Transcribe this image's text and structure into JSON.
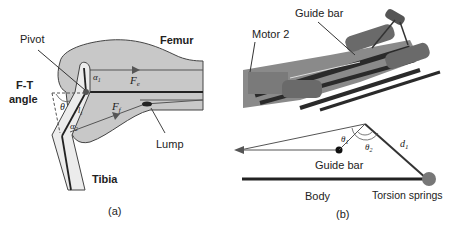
{
  "panel_a": {
    "caption": "(a)",
    "labels": {
      "pivot": "Pivot",
      "femur": "Femur",
      "ft_angle_line1": "F-T",
      "ft_angle_line2": "angle",
      "lump": "Lump",
      "tibia": "Tibia"
    },
    "symbols": {
      "alpha1": "α",
      "alpha1_sub": "1",
      "alpha2": "α",
      "alpha2_sub": "2",
      "l1": "l",
      "l1_sub": "1",
      "theta": "θ",
      "fe": "F",
      "fe_sub": "e",
      "ff": "F",
      "ff_sub": "f"
    },
    "colors": {
      "femur_fill": "#c8c8c8",
      "tibia_fill": "#e6e6e6",
      "stroke": "#333333"
    }
  },
  "panel_b": {
    "caption": "(b)",
    "labels": {
      "guide_bar_top": "Guide bar",
      "motor2": "Motor 2",
      "guide_bar_bottom": "Guide bar",
      "body": "Body",
      "torsion_springs": "Torsion springs"
    },
    "symbols": {
      "theta1": "θ",
      "theta1_sub": "1",
      "theta2": "θ",
      "theta2_sub": "2",
      "d1": "d",
      "d1_sub": "1"
    },
    "colors": {
      "spring_fill": "#777777",
      "body_line": "#222222",
      "render_dark": "#3a3a3a",
      "render_mid": "#8a8a8a"
    }
  }
}
